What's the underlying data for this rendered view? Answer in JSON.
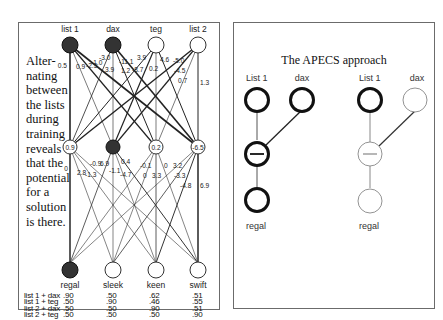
{
  "left_panel": {
    "side_text": "Alter-nating between the lists during training reveals that the potential for a solution is there.",
    "side_lines": [
      "Alter-",
      "nating",
      "between",
      "the lists",
      "during",
      "training",
      "reveals",
      "that the",
      "potential",
      "for a",
      "solution",
      "is there."
    ],
    "input_nodes": [
      {
        "label": "list 1",
        "filled": true
      },
      {
        "label": "dax",
        "filled": true
      },
      {
        "label": "teg",
        "filled": false
      },
      {
        "label": "list 2",
        "filled": false
      }
    ],
    "hidden_nodes": [
      {
        "value": "0.9",
        "filled": false
      },
      {
        "value": "",
        "filled": true
      },
      {
        "value": "0.2",
        "filled": false
      },
      {
        "value": "-6.5",
        "filled": false
      }
    ],
    "output_nodes": [
      {
        "label": "regal",
        "filled": true
      },
      {
        "label": "sleek",
        "filled": false
      },
      {
        "label": "keen",
        "filled": false
      },
      {
        "label": "swift",
        "filled": false
      }
    ],
    "input_hidden_weights": [
      "0.5",
      "0.9",
      "-2.5",
      "-1.0",
      "-3.0",
      "3.9",
      "-11.1",
      "1.2",
      "3.9",
      "-8.7",
      "0.2",
      "4.6",
      "-5.0",
      "-4.5",
      "0.7",
      "1.3"
    ],
    "hidden_output_weights": [
      "0",
      "2.8",
      "-1.3",
      "-0.9",
      "6.9",
      "-1.1",
      "0.4",
      "-4.7",
      "-0.1",
      "0",
      "3.3",
      "0",
      "3.2",
      "-3.3",
      "-4.8",
      "6.9"
    ],
    "table": {
      "row_labels": [
        "list 1 + dax",
        "list 1 + teg",
        "list 2 + dax",
        "list 2 + teg"
      ],
      "columns": [
        {
          "header": "regal",
          "values": [
            ".90",
            ".50",
            ".50",
            ".50"
          ]
        },
        {
          "header": "sleek",
          "values": [
            ".50",
            ".90",
            ".50",
            ".50"
          ]
        },
        {
          "header": "keen",
          "values": [
            ".62",
            ".46",
            ".90",
            ".50"
          ]
        },
        {
          "header": "swift",
          "values": [
            ".51",
            ".55",
            ".51",
            ".90"
          ]
        }
      ]
    }
  },
  "right_panel": {
    "title": "The APECS approach",
    "left_diagram": {
      "top_labels": [
        "List 1",
        "dax"
      ],
      "bottom_label": "regal",
      "style": "bold"
    },
    "right_diagram": {
      "top_labels": [
        "List 1",
        "dax"
      ],
      "bottom_label": "regal",
      "style": "faded"
    }
  }
}
